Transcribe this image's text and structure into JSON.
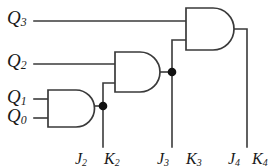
{
  "figure": {
    "type": "logic-circuit-diagram",
    "width": 275,
    "height": 166,
    "background_color": "#ffffff",
    "wire_color": "#3a3a3a",
    "text_color": "#1a1a1a"
  },
  "inputs": [
    {
      "name": "q3",
      "base": "Q",
      "sub": "3",
      "text": "Q3"
    },
    {
      "name": "q2",
      "base": "Q",
      "sub": "2",
      "text": "Q2"
    },
    {
      "name": "q1",
      "base": "Q",
      "sub": "1",
      "text": "Q1"
    },
    {
      "name": "q0",
      "base": "Q",
      "sub": "0",
      "text": "Q0"
    }
  ],
  "outputs": [
    {
      "name": "j2",
      "base": "J",
      "sub": "2",
      "text": "J2"
    },
    {
      "name": "k2",
      "base": "K",
      "sub": "2",
      "text": "K2"
    },
    {
      "name": "j3",
      "base": "J",
      "sub": "3",
      "text": "J3"
    },
    {
      "name": "k3",
      "base": "K",
      "sub": "3",
      "text": "K3"
    },
    {
      "name": "j4",
      "base": "J",
      "sub": "4",
      "text": "J4"
    },
    {
      "name": "k4",
      "base": "K",
      "sub": "4",
      "text": "K4"
    }
  ],
  "gates": [
    {
      "name": "and-gate-1",
      "type": "AND",
      "inputs": [
        "Q1",
        "Q0"
      ],
      "output": "J2 K2"
    },
    {
      "name": "and-gate-2",
      "type": "AND",
      "inputs": [
        "Q2",
        "Q1·Q0"
      ],
      "output": "J3 K3"
    },
    {
      "name": "and-gate-3",
      "type": "AND",
      "inputs": [
        "Q3",
        "Q2·Q1·Q0"
      ],
      "output": "J4 K4"
    }
  ],
  "junctions": [
    {
      "name": "junction-1",
      "x": 103,
      "y": 106
    },
    {
      "name": "junction-2",
      "x": 172,
      "y": 72
    }
  ]
}
